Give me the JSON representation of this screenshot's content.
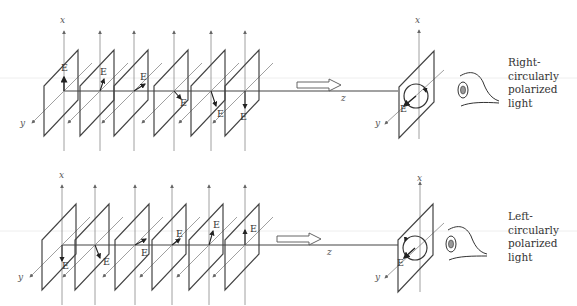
{
  "panels": [
    {
      "id": "right",
      "axis_labels": {
        "x": "x",
        "y": "y",
        "z": "z"
      },
      "field_label": "E",
      "caption": [
        "Right-",
        "circularly",
        "polarized",
        "light"
      ],
      "caption_text": "Right-circularly polarized light",
      "field_vectors_deg": [
        90,
        60,
        30,
        -30,
        -60,
        -90
      ]
    },
    {
      "id": "left",
      "axis_labels": {
        "x": "x",
        "y": "y",
        "z": "z"
      },
      "field_label": "E",
      "caption": [
        "Left-",
        "circularly",
        "polarized",
        "light"
      ],
      "caption_text": "Left-circularly polarized light",
      "field_vectors_deg": [
        -90,
        -60,
        -30,
        30,
        60,
        90
      ]
    }
  ],
  "colors": {
    "line": "#444444",
    "axis": "#777777",
    "guide": "#e6e6e6",
    "pupil": "#999999"
  }
}
